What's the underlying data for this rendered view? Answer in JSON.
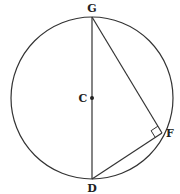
{
  "diagram": {
    "type": "geometry-circle",
    "stroke_color": "#333333",
    "background": "#ffffff",
    "circle": {
      "center_label": "C",
      "cx": 92,
      "cy": 98,
      "r": 81
    },
    "points": {
      "G": {
        "label": "G",
        "x": 92,
        "y": 17
      },
      "C": {
        "label": "C",
        "x": 92,
        "y": 98
      },
      "D": {
        "label": "D",
        "x": 92,
        "y": 179
      },
      "F": {
        "label": "F",
        "x": 162,
        "y": 133
      }
    },
    "segments": [
      {
        "from": "G",
        "to": "D",
        "name": "diameter-GD"
      },
      {
        "from": "G",
        "to": "F",
        "name": "chord-GF"
      },
      {
        "from": "D",
        "to": "F",
        "name": "chord-DF"
      }
    ],
    "right_angle_at": "F",
    "labels": {
      "G": "G",
      "C": "C",
      "D": "D",
      "F": "F"
    }
  }
}
